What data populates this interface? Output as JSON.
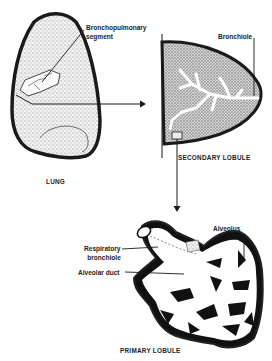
{
  "diagram": {
    "panels": [
      {
        "id": "lung",
        "caption": "LUNG",
        "labels": [
          {
            "text": "Bronchopulmonary",
            "line2": "segment"
          }
        ]
      },
      {
        "id": "secondary-lobule",
        "caption": "SECONDARY LOBULE",
        "labels": [
          {
            "text": "Bronchiole"
          }
        ]
      },
      {
        "id": "primary-lobule",
        "caption": "PRIMARY LOBULE",
        "labels": [
          {
            "text": "Alveolus"
          },
          {
            "text": "Respiratory",
            "line2": "bronchiole"
          },
          {
            "text": "Alveolar duct"
          }
        ]
      }
    ],
    "arrows": [
      {
        "from": "lung",
        "to": "secondary-lobule"
      },
      {
        "from": "secondary-lobule",
        "to": "primary-lobule"
      }
    ],
    "colors": {
      "ink": "#1a1a1a",
      "stipple": "#888888",
      "background": "#ffffff"
    }
  }
}
